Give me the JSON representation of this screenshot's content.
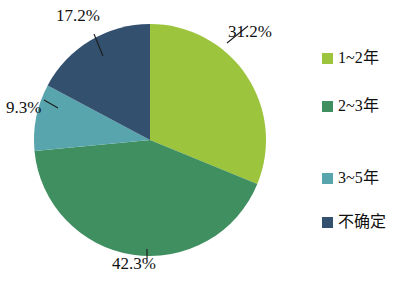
{
  "chart_data": {
    "type": "pie",
    "title": "",
    "subtitle": "",
    "xlabel": "",
    "ylabel": "",
    "legend_position": "right",
    "grid": false,
    "categories": [
      "1~2年",
      "2~3年",
      "3~5年",
      "不确定"
    ],
    "values": [
      31.2,
      42.3,
      9.3,
      17.2
    ],
    "value_labels": [
      "31.2%",
      "42.3%",
      "9.3%",
      "17.2%"
    ],
    "colors": [
      "#9cc43c",
      "#3f8f60",
      "#59a5ad",
      "#33506e"
    ],
    "start_angle_deg": 0,
    "direction": "clockwise",
    "slices": [
      {
        "label": "1~2年",
        "value": 31.2,
        "value_label": "31.2%",
        "color": "#9cc43c",
        "start_deg": 0,
        "end_deg": 112.32
      },
      {
        "label": "2~3年",
        "value": 42.3,
        "value_label": "42.3%",
        "color": "#3f8f60",
        "start_deg": 112.32,
        "end_deg": 264.6
      },
      {
        "label": "3~5年",
        "value": 9.3,
        "value_label": "9.3%",
        "color": "#59a5ad",
        "start_deg": 264.6,
        "end_deg": 298.08
      },
      {
        "label": "不确定",
        "value": 17.2,
        "value_label": "17.2%",
        "color": "#33506e",
        "start_deg": 298.08,
        "end_deg": 360
      }
    ]
  },
  "legend": {
    "items": [
      {
        "label": "1~2年",
        "color": "#9cc43c"
      },
      {
        "label": "2~3年",
        "color": "#3f8f60"
      },
      {
        "label": "3~5年",
        "color": "#59a5ad"
      },
      {
        "label": "不确定",
        "color": "#33506e"
      }
    ]
  },
  "labels": {
    "top_right": "31.2%",
    "bottom": "42.3%",
    "left": "9.3%",
    "top_left": "17.2%"
  }
}
